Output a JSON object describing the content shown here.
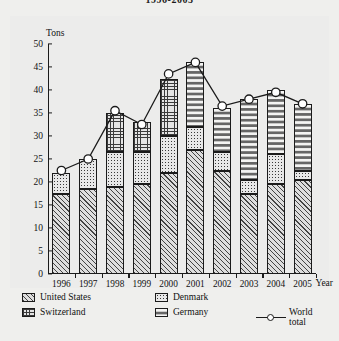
{
  "title": "1996-2005",
  "axis": {
    "y_label": "Tons",
    "x_label": "Year",
    "y_ticks": [
      0,
      5,
      10,
      15,
      20,
      25,
      30,
      35,
      40,
      45,
      50
    ]
  },
  "legend": {
    "items": [
      {
        "key": "united_states",
        "label": "United States",
        "pattern": "diagonal-hatch"
      },
      {
        "key": "denmark",
        "label": "Denmark",
        "pattern": "dotted"
      },
      {
        "key": "switzerland",
        "label": "Switzerland",
        "pattern": "cross-hatch-grid"
      },
      {
        "key": "germany",
        "label": "Germany",
        "pattern": "dashed-vertical"
      },
      {
        "key": "world_total",
        "label": "World total",
        "pattern": "line-circle-marker"
      }
    ]
  },
  "chart_data": {
    "type": "bar",
    "title": "1996-2005",
    "xlabel": "Year",
    "ylabel": "Tons",
    "ylim": [
      0,
      50
    ],
    "grid": false,
    "legend_position": "bottom",
    "stacked": true,
    "categories": [
      "1996",
      "1997",
      "1998",
      "1999",
      "2000",
      "2001",
      "2002",
      "2003",
      "2004",
      "2005"
    ],
    "series": [
      {
        "name": "United States",
        "values": [
          17.5,
          18.5,
          19.0,
          19.5,
          22.0,
          27.0,
          22.5,
          17.5,
          19.5,
          20.5
        ]
      },
      {
        "name": "Denmark",
        "values": [
          4.5,
          6.5,
          7.5,
          7.0,
          8.0,
          5.0,
          4.0,
          3.0,
          6.5,
          2.0
        ]
      },
      {
        "name": "Switzerland",
        "values": [
          0,
          0,
          8.5,
          6.5,
          12.5,
          0,
          0,
          0,
          0,
          0
        ]
      },
      {
        "name": "Germany",
        "values": [
          0,
          0,
          0,
          0,
          0,
          14.0,
          9.5,
          17.5,
          14.0,
          14.5
        ]
      }
    ],
    "overlay": {
      "name": "World total",
      "type": "line",
      "marker": "circle",
      "values": [
        22.5,
        25.0,
        35.5,
        32.5,
        43.5,
        46.0,
        36.5,
        38.0,
        39.5,
        37.0
      ]
    }
  }
}
